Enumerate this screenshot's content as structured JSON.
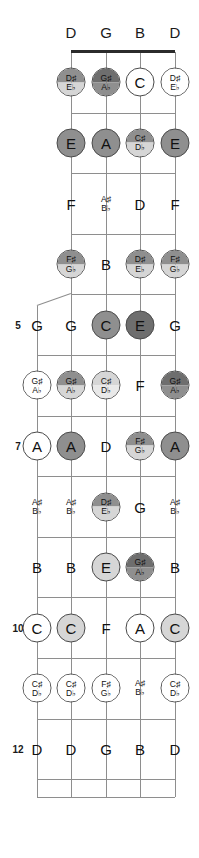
{
  "diagram": {
    "instrument": "5-string banjo fretboard",
    "tuning_headers": [
      "D",
      "G",
      "B",
      "D"
    ],
    "fret_numbers": [
      "5",
      "7",
      "10",
      "12"
    ],
    "string_count": 5,
    "fifth_string_starts_at_fret": 5,
    "colors": {
      "string": "#8e8e8e",
      "fretline": "#8e8e8e",
      "nut": "#2b2b2b",
      "circle_border": "#4a4a4a",
      "text": "#111111",
      "fill_white": "#ffffff",
      "fill_light": "#d6d6d6",
      "fill_medium": "#b3b3b3",
      "fill_dark": "#8f8f8f",
      "fill_darkest": "#6e6e6e"
    }
  },
  "chart_data": {
    "type": "table",
    "xlabel": "String",
    "ylabel": "Fret",
    "categories": [
      "5th",
      "4th (D)",
      "3rd (G)",
      "2nd (B)",
      "1st (D)"
    ],
    "open_strings": [
      "",
      "D",
      "G",
      "B",
      "D"
    ],
    "frets": [
      {
        "fret": "1",
        "notes": [
          {
            "string": 0,
            "show": false
          },
          {
            "string": 1,
            "natural": "D",
            "sharp": "D♯",
            "flat": "E♭",
            "style": "circ",
            "fill": "fill_dark"
          },
          {
            "string": 2,
            "natural": "G",
            "sharp": "G♯",
            "flat": "A♭",
            "style": "circ",
            "fill": "fill_darkest"
          },
          {
            "string": 3,
            "natural": "C",
            "style": "circ",
            "fill": "fill_white"
          },
          {
            "string": 4,
            "natural": "D",
            "sharp": "D♯",
            "flat": "E♭",
            "style": "circ",
            "fill": "fill_white"
          }
        ]
      },
      {
        "fret": "2",
        "notes": [
          {
            "string": 0,
            "show": false
          },
          {
            "string": 1,
            "natural": "E",
            "style": "circ",
            "fill": "fill_dark"
          },
          {
            "string": 2,
            "natural": "A",
            "style": "circ",
            "fill": "fill_dark"
          },
          {
            "string": 3,
            "natural": "C",
            "sharp": "C♯",
            "flat": "D♭",
            "style": "circ",
            "fill": "fill_dark"
          },
          {
            "string": 4,
            "natural": "E",
            "style": "circ",
            "fill": "fill_dark"
          }
        ]
      },
      {
        "fret": "3",
        "notes": [
          {
            "string": 0,
            "show": false
          },
          {
            "string": 1,
            "natural": "F",
            "style": "plain"
          },
          {
            "string": 2,
            "sharp": "A♯",
            "flat": "B♭",
            "style": "plain"
          },
          {
            "string": 3,
            "natural": "D",
            "style": "plain"
          },
          {
            "string": 4,
            "natural": "F",
            "style": "plain"
          }
        ]
      },
      {
        "fret": "4",
        "notes": [
          {
            "string": 0,
            "show": false
          },
          {
            "string": 1,
            "sharp": "F♯",
            "flat": "G♭",
            "style": "circ",
            "fill": "fill_dark"
          },
          {
            "string": 2,
            "natural": "B",
            "style": "plain"
          },
          {
            "string": 3,
            "sharp": "D♯",
            "flat": "E♭",
            "style": "circ",
            "fill": "fill_dark"
          },
          {
            "string": 4,
            "sharp": "F♯",
            "flat": "G♭",
            "style": "circ",
            "fill": "fill_dark"
          }
        ]
      },
      {
        "fret": "5",
        "label": "5",
        "notes": [
          {
            "string": 0,
            "natural": "G",
            "style": "plain"
          },
          {
            "string": 1,
            "natural": "G",
            "style": "plain"
          },
          {
            "string": 2,
            "natural": "C",
            "style": "circ",
            "fill": "fill_dark"
          },
          {
            "string": 3,
            "natural": "E",
            "style": "circ",
            "fill": "fill_darkest"
          },
          {
            "string": 4,
            "natural": "G",
            "style": "plain"
          }
        ]
      },
      {
        "fret": "6",
        "notes": [
          {
            "string": 0,
            "sharp": "G♯",
            "flat": "A♭",
            "style": "circ",
            "fill": "fill_white"
          },
          {
            "string": 1,
            "sharp": "G♯",
            "flat": "A♭",
            "style": "circ",
            "fill": "fill_dark"
          },
          {
            "string": 2,
            "sharp": "C♯",
            "flat": "D♭",
            "style": "circ",
            "fill": "fill_light"
          },
          {
            "string": 3,
            "natural": "F",
            "style": "plain"
          },
          {
            "string": 4,
            "sharp": "G♯",
            "flat": "A♭",
            "style": "circ",
            "fill": "fill_darkest"
          }
        ]
      },
      {
        "fret": "7",
        "label": "7",
        "notes": [
          {
            "string": 0,
            "natural": "A",
            "style": "circ",
            "fill": "fill_white"
          },
          {
            "string": 1,
            "natural": "A",
            "style": "circ",
            "fill": "fill_dark"
          },
          {
            "string": 2,
            "natural": "D",
            "style": "plain"
          },
          {
            "string": 3,
            "sharp": "F♯",
            "flat": "G♭",
            "style": "circ",
            "fill": "fill_dark"
          },
          {
            "string": 4,
            "natural": "A",
            "style": "circ",
            "fill": "fill_dark"
          }
        ]
      },
      {
        "fret": "8",
        "notes": [
          {
            "string": 0,
            "sharp": "A♯",
            "flat": "B♭",
            "style": "plain"
          },
          {
            "string": 1,
            "sharp": "A♯",
            "flat": "B♭",
            "style": "plain"
          },
          {
            "string": 2,
            "sharp": "D♯",
            "flat": "E♭",
            "style": "circ",
            "fill": "fill_dark"
          },
          {
            "string": 3,
            "natural": "G",
            "style": "plain"
          },
          {
            "string": 4,
            "sharp": "A♯",
            "flat": "B♭",
            "style": "plain"
          }
        ]
      },
      {
        "fret": "9",
        "notes": [
          {
            "string": 0,
            "natural": "B",
            "style": "plain"
          },
          {
            "string": 1,
            "natural": "B",
            "style": "plain"
          },
          {
            "string": 2,
            "natural": "E",
            "style": "circ",
            "fill": "fill_light"
          },
          {
            "string": 3,
            "sharp": "G♯",
            "flat": "A♭",
            "style": "circ",
            "fill": "fill_darkest"
          },
          {
            "string": 4,
            "natural": "B",
            "style": "plain"
          }
        ]
      },
      {
        "fret": "10",
        "label": "10",
        "notes": [
          {
            "string": 0,
            "natural": "C",
            "style": "circ",
            "fill": "fill_white"
          },
          {
            "string": 1,
            "natural": "C",
            "style": "circ",
            "fill": "fill_light"
          },
          {
            "string": 2,
            "natural": "F",
            "style": "plain"
          },
          {
            "string": 3,
            "natural": "A",
            "style": "circ",
            "fill": "fill_white"
          },
          {
            "string": 4,
            "natural": "C",
            "style": "circ",
            "fill": "fill_light"
          }
        ]
      },
      {
        "fret": "11",
        "notes": [
          {
            "string": 0,
            "sharp": "C♯",
            "flat": "D♭",
            "style": "circ",
            "fill": "fill_white"
          },
          {
            "string": 1,
            "sharp": "C♯",
            "flat": "D♭",
            "style": "circ",
            "fill": "fill_white"
          },
          {
            "string": 2,
            "sharp": "F♯",
            "flat": "G♭",
            "style": "circ",
            "fill": "fill_white"
          },
          {
            "string": 3,
            "sharp": "A♯",
            "flat": "B♭",
            "style": "plain"
          },
          {
            "string": 4,
            "sharp": "C♯",
            "flat": "D♭",
            "style": "circ",
            "fill": "fill_white"
          }
        ]
      },
      {
        "fret": "12",
        "label": "12",
        "notes": [
          {
            "string": 0,
            "natural": "D",
            "style": "plain"
          },
          {
            "string": 1,
            "natural": "D",
            "style": "plain"
          },
          {
            "string": 2,
            "natural": "G",
            "style": "plain"
          },
          {
            "string": 3,
            "natural": "B",
            "style": "plain"
          },
          {
            "string": 4,
            "natural": "D",
            "style": "plain"
          }
        ]
      }
    ]
  }
}
